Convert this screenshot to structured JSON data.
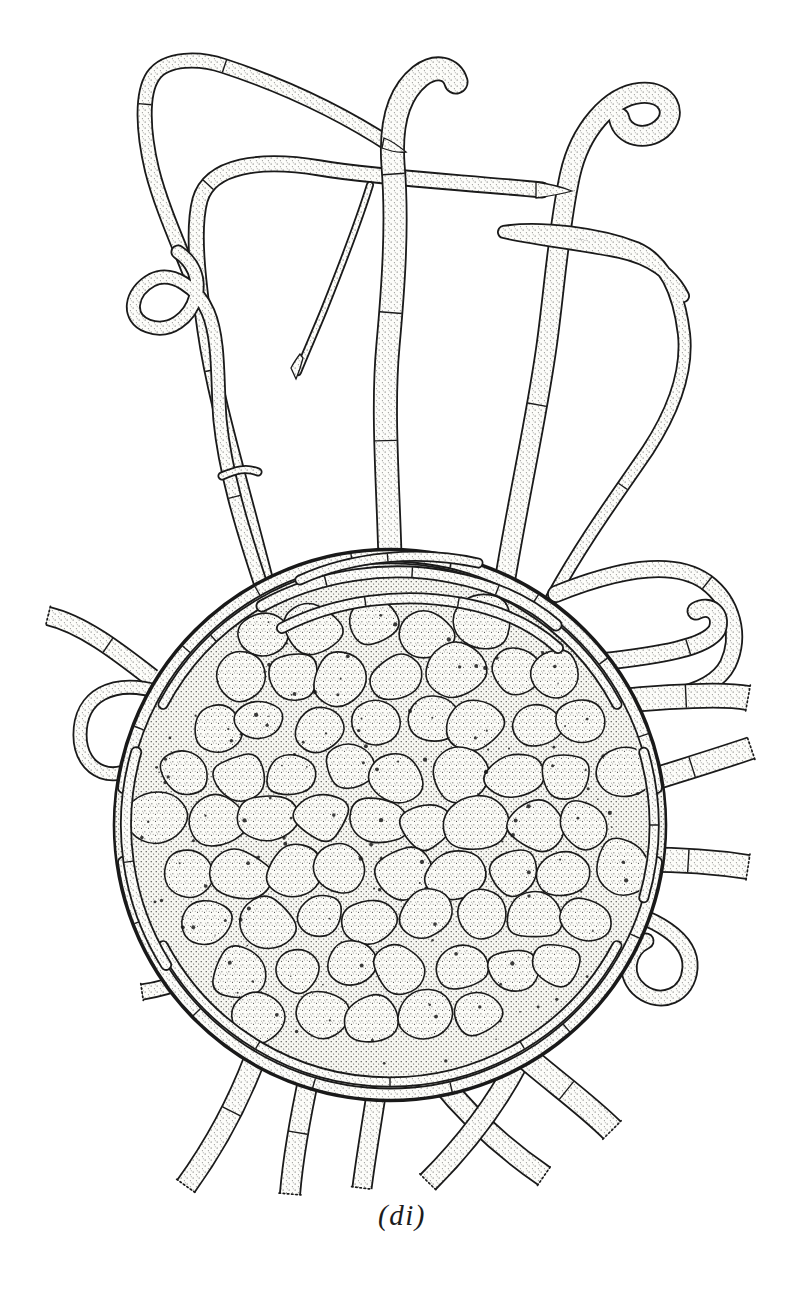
{
  "caption": {
    "text": "(di)"
  },
  "illustration": {
    "description": "Stippled pen-and-ink drawing of a spherical cellular body sheathed by wrapping hyphae, with long winding tubular appendages radiating outward",
    "ink": "#1a1a1a",
    "paper": "#ffffff",
    "seed": 20250407,
    "sphere": {
      "cx": 390,
      "cy": 825,
      "r": 276
    },
    "cells": {
      "spacing": 54,
      "speckles": 150
    },
    "sheathArcs": [
      {
        "a0": 188,
        "a1": 352,
        "dr": 7,
        "w": 13,
        "septa": [
          0.08,
          0.2,
          0.32,
          0.45,
          0.58,
          0.7,
          0.82,
          0.93
        ]
      },
      {
        "a0": 208,
        "a1": 332,
        "dr": 19,
        "w": 11,
        "septa": [
          0.15,
          0.38,
          0.6,
          0.82
        ]
      },
      {
        "a0": 8,
        "a1": 172,
        "dr": 7,
        "w": 13,
        "septa": [
          0.1,
          0.25,
          0.42,
          0.6,
          0.78,
          0.92
        ]
      },
      {
        "a0": 28,
        "a1": 152,
        "dr": 19,
        "w": 11,
        "septa": [
          0.25,
          0.5,
          0.75
        ]
      },
      {
        "a0": 148,
        "a1": 196,
        "dr": 12,
        "w": 12,
        "septa": [
          0.5
        ]
      },
      {
        "a0": 344,
        "a1": 16,
        "dr": 12,
        "w": 11,
        "septa": [
          0.5
        ]
      }
    ],
    "tubes_back": [
      {
        "name": "top-left-hairpin-appendage",
        "d": "M212,332 C192,272 164,218 152,170 C143,132 141,94 153,76 C166,57 200,58 224,66 C282,85 340,112 392,146",
        "w": 16,
        "septa": [
          0.45,
          0.65
        ]
      },
      {
        "name": "top-left-long-run-appendage",
        "d": "M268,590 C240,480 215,400 205,330 C198,280 192,230 200,200 C210,165 260,158 320,168 C380,178 460,182 542,190",
        "w": 17,
        "septa": [
          0.3,
          0.55,
          0.8
        ]
      },
      {
        "name": "central-tall-appendage",
        "d": "M390,558 C388,482 382,410 388,345 C393,290 398,225 393,165 C390,122 400,92 420,76 C436,64 452,68 456,82",
        "w": 25,
        "septa": [
          0.22,
          0.46,
          0.72
        ]
      },
      {
        "name": "right-tall-appendage",
        "d": "M505,580 C520,490 536,420 546,350 C554,295 558,230 570,175 C580,130 610,96 640,93 C668,90 679,114 661,129 C646,141 623,137 619,118",
        "w": 22,
        "septa": [
          0.28,
          0.55
        ]
      },
      {
        "name": "right-hairpin-lips-appendage",
        "d": "M552,598 C584,540 618,494 648,450 C674,410 688,372 684,334 C680,300 668,262 636,248 C600,234 540,226 504,232 C540,240 584,244 620,252 C652,259 672,274 683,296",
        "w": 14,
        "septa": [
          0.18
        ]
      },
      {
        "name": "right-outer-appendage",
        "d": "M556,594 C616,570 672,558 706,582 C733,602 741,636 728,664 C720,680 700,692 672,696",
        "w": 18,
        "septa": [
          0.5
        ]
      },
      {
        "name": "left-wavy-loop-appendage",
        "d": "M262,588 C240,522 225,470 220,420 C217,385 220,340 208,312 C198,288 172,270 152,280 C130,292 126,318 148,326 C170,334 190,318 196,296 C200,278 193,262 178,252",
        "w": 15,
        "septa": [
          0.18
        ]
      },
      {
        "name": "thin-tapering-spur-tube",
        "d": "M370,185 C356,230 340,270 324,310 C315,332 306,352 298,372",
        "w": 8
      },
      {
        "name": "knob-spur-tube",
        "d": "M222,476 C236,470 246,467 258,472",
        "w": 9
      },
      {
        "name": "left-open-tube",
        "d": "M48,616 C82,624 116,650 152,678",
        "w": 20,
        "open": [
          0
        ],
        "septa": [
          0.55
        ]
      },
      {
        "name": "left-lower-loop-tube",
        "d": "M160,692 C112,678 80,696 80,735 C80,774 118,786 142,760 C156,744 158,726 156,710",
        "w": 15
      },
      {
        "name": "right-stub-curl",
        "d": "M600,662 C660,655 706,648 717,630 C723,614 710,603 696,611",
        "w": 19,
        "septa": [
          0.55
        ]
      },
      {
        "name": "right-stub-1",
        "d": "M610,702 C672,696 722,693 748,698",
        "w": 26,
        "open": [
          1
        ],
        "septa": [
          0.55
        ]
      },
      {
        "name": "right-stub-2",
        "d": "M620,790 C676,772 722,758 751,748",
        "w": 24,
        "open": [
          1
        ],
        "septa": [
          0.55
        ]
      },
      {
        "name": "right-stub-3",
        "d": "M615,860 C676,858 722,863 748,867",
        "w": 26,
        "open": [
          1
        ],
        "septa": [
          0.55
        ]
      },
      {
        "name": "right-lower-loop-tube",
        "d": "M600,905 C658,916 692,940 690,968 C688,996 661,1006 641,991 C623,977 626,951 646,941",
        "w": 17
      },
      {
        "name": "bottom-left-stub",
        "d": "M190,978 C172,986 156,990 142,992",
        "w": 17,
        "open": [
          1
        ]
      },
      {
        "name": "bottom-tube-1",
        "d": "M255,1058 C236,1108 212,1150 186,1186",
        "w": 23,
        "open": [
          1
        ],
        "septa": [
          0.4
        ]
      },
      {
        "name": "bottom-tube-2",
        "d": "M310,1072 C300,1118 293,1158 290,1194",
        "w": 22,
        "open": [
          1
        ],
        "septa": [
          0.5
        ]
      },
      {
        "name": "bottom-tube-3",
        "d": "M378,1082 C372,1122 366,1156 362,1188",
        "w": 21,
        "open": [
          1
        ]
      },
      {
        "name": "bottom-tube-4",
        "d": "M438,1078 C470,1118 506,1150 544,1176",
        "w": 23,
        "open": [
          1
        ],
        "septa": [
          0.45
        ]
      },
      {
        "name": "bottom-tube-5",
        "d": "M518,1062 C494,1108 462,1148 428,1182",
        "w": 23,
        "open": [
          1
        ]
      },
      {
        "name": "bottom-right-diagonal-tube",
        "d": "M520,1052 C552,1080 586,1104 612,1130",
        "w": 26,
        "open": [
          1
        ],
        "septa": [
          0.5
        ]
      }
    ],
    "tubes_front": [
      {
        "name": "sheath-tangle-1",
        "d": "M262,606 C320,574 390,565 450,577 C498,586 532,604 556,625",
        "w": 13,
        "septa": [
          0.22,
          0.5,
          0.78
        ]
      },
      {
        "name": "sheath-tangle-2",
        "d": "M282,628 C336,600 402,592 462,603 C505,611 536,628 558,648",
        "w": 12,
        "septa": [
          0.3,
          0.62
        ]
      },
      {
        "name": "sheath-tangle-3",
        "d": "M300,580 C352,556 420,550 478,563",
        "w": 11,
        "septa": [
          0.5
        ]
      }
    ],
    "spurs": [
      {
        "name": "pointed-tail-tip",
        "d": "M303,358 C301,366 299,372 296,379 L291,368 C294,362 297,358 300,354 Z"
      },
      {
        "name": "long-run-taper-tip",
        "d": "M536,182 C550,184 562,187 572,191 C562,194 550,196 536,198 Z"
      },
      {
        "name": "hairpin-arm-taper-tip",
        "d": "M384,138 C392,141 400,147 406,152 C398,153 390,151 382,148 Z"
      }
    ]
  }
}
